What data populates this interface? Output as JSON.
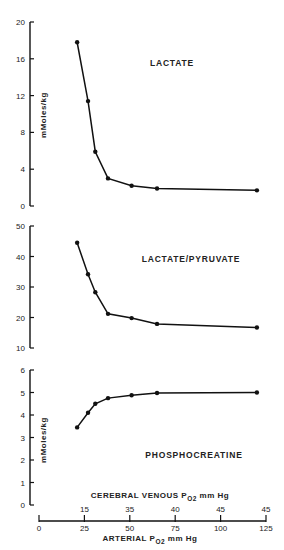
{
  "chart_data": [
    {
      "type": "line",
      "title": "LACTATE",
      "ylabel": "mMoles/kg",
      "xlabel": "ARTERIAL PO2 mm Hg",
      "ylim": [
        0,
        20
      ],
      "yticks": [
        0,
        4,
        8,
        12,
        16,
        20
      ],
      "x": [
        21,
        27,
        31,
        38,
        51,
        65,
        120
      ],
      "values": [
        17.8,
        11.4,
        5.9,
        3.0,
        2.2,
        1.9,
        1.7
      ]
    },
    {
      "type": "line",
      "title": "LACTATE/PYRUVATE",
      "ylabel": "",
      "xlabel": "ARTERIAL PO2 mm Hg",
      "ylim": [
        10,
        50
      ],
      "yticks": [
        10,
        20,
        30,
        40,
        50
      ],
      "x": [
        21,
        27,
        31,
        38,
        51,
        65,
        120
      ],
      "values": [
        44.5,
        34.2,
        28.3,
        21.2,
        19.8,
        17.9,
        16.7
      ]
    },
    {
      "type": "line",
      "title": "PHOSPHOCREATINE",
      "ylabel": "mMoles/kg",
      "xlabel": "ARTERIAL PO2 mm Hg",
      "ylim": [
        0,
        6
      ],
      "yticks": [
        0,
        1,
        2,
        3,
        4,
        5,
        6
      ],
      "x": [
        21,
        27,
        31,
        38,
        51,
        65,
        120
      ],
      "values": [
        3.45,
        4.1,
        4.5,
        4.75,
        4.88,
        4.98,
        5.0
      ]
    }
  ],
  "x_axis": {
    "arterial_label": "ARTERIAL P",
    "arterial_sub": "O2",
    "arterial_unit": "mm Hg",
    "arterial_ticks": [
      "0",
      "25",
      "50",
      "75",
      "100",
      "125"
    ],
    "venous_label": "CEREBRAL VENOUS P",
    "venous_sub": "O2",
    "venous_unit": "mm Hg",
    "venous_ticks": [
      "15",
      "35",
      "40",
      "45",
      "45"
    ]
  },
  "labels": {
    "lactate": "LACTATE",
    "lp": "LACTATE/PYRUVATE",
    "pcr": "PHOSPHOCREATINE",
    "ylabel1": "mMoles/kg",
    "ylabel3": "mMoles/kg"
  }
}
